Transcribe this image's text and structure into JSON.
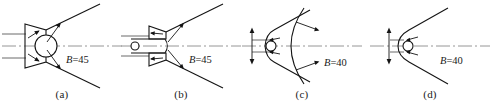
{
  "figure": {
    "type": "schematic-diagram",
    "panels": [
      {
        "id": "a",
        "caption": "(a)",
        "angle_label_prefix": "B",
        "angle_label_eq": "=",
        "angle_label_value": "45",
        "angle_label": "B=45",
        "body": "circle-with-attached-wedge",
        "shock": "attached-straight-oblique",
        "incoming_streamlines": 2,
        "velocity_arrows": 4,
        "has_vertical_double_arrow": false
      },
      {
        "id": "b",
        "caption": "(b)",
        "angle_label_prefix": "B",
        "angle_label_eq": "=",
        "angle_label_value": "45",
        "angle_label": "B=45",
        "body": "rounded-nose-cylinder-with-small-circle",
        "shock": "attached-straight-oblique",
        "incoming_streamlines": 2,
        "velocity_arrows": 4,
        "has_vertical_double_arrow": false
      },
      {
        "id": "c",
        "caption": "(c)",
        "angle_label_prefix": "B",
        "angle_label_eq": "=",
        "angle_label_value": "40",
        "angle_label": "B=40",
        "body": "pointed-blunt-body-with-small-circle",
        "shock": "detached-curved-bow-shock",
        "incoming_streamlines": 2,
        "velocity_arrows": 4,
        "has_vertical_double_arrow": true
      },
      {
        "id": "d",
        "caption": "(d)",
        "angle_label_prefix": "B",
        "angle_label_eq": "=",
        "angle_label_value": "40",
        "angle_label": "B=40",
        "body": "rounded-nose-wedge-with-small-circle",
        "shock": "attached-curved-nose",
        "incoming_streamlines": 2,
        "velocity_arrows": 2,
        "has_vertical_double_arrow": true
      }
    ],
    "colors": {
      "line": "#141414",
      "axis": "#8b8b8b",
      "stream": "#5a5a5a",
      "text": "#1a1a1a",
      "background": "#ffffff"
    }
  }
}
